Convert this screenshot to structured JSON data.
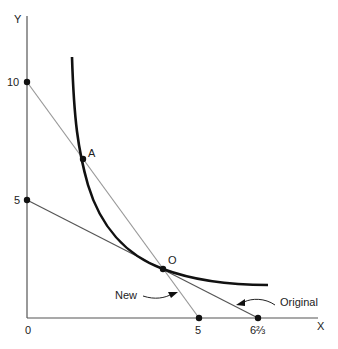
{
  "diagram": {
    "axes": {
      "x_label": "X",
      "y_label": "Y",
      "origin_label": "0",
      "y_ticks": [
        {
          "value": 10,
          "label": "10"
        },
        {
          "value": 5,
          "label": "5"
        }
      ],
      "x_ticks": [
        {
          "value": 5,
          "label": "5"
        },
        {
          "value": 6.667,
          "label": "6⅔"
        }
      ]
    },
    "points": [
      {
        "name": "A",
        "label": "A"
      },
      {
        "name": "O",
        "label": "O"
      }
    ],
    "lines": [
      {
        "name": "new-budget-line",
        "label": "New",
        "from": [
          0,
          10
        ],
        "to": [
          5,
          0
        ]
      },
      {
        "name": "original-budget-line",
        "label": "Original",
        "from": [
          0,
          5
        ],
        "to": [
          6.667,
          0
        ]
      }
    ],
    "curve": {
      "name": "indifference-curve",
      "description": "convex curve through A and O"
    },
    "colors": {
      "axis": "#555555",
      "curve": "#111111",
      "new_line": "#999999",
      "original_line": "#555555",
      "points": "#111111"
    }
  }
}
